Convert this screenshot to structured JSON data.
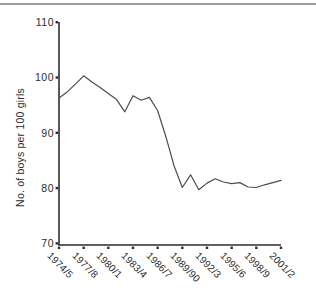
{
  "figure": {
    "background": "#ffffff",
    "top_rule_color": "#9d9d9d",
    "axis_color": "#2d2d2d",
    "line_color": "#4d4d4d"
  },
  "chart_data": {
    "type": "line",
    "title": "",
    "xlabel": "",
    "ylabel": "No. of boys per 100 girls",
    "ylim": [
      70,
      110
    ],
    "grid": false,
    "legend_position": "none",
    "y_ticks": [
      110,
      100,
      90,
      80,
      70
    ],
    "x_tick_labels": [
      "1974/5",
      "1977/8",
      "1980/1",
      "1983/4",
      "1986/7",
      "1989/90",
      "1992/3",
      "1995/6",
      "1998/9",
      "2001/2"
    ],
    "categories": [
      "1974/5",
      "1975/6",
      "1976/7",
      "1977/8",
      "1978/9",
      "1979/80",
      "1980/1",
      "1981/2",
      "1982/3",
      "1983/4",
      "1984/5",
      "1985/6",
      "1986/7",
      "1987/8",
      "1988/9",
      "1989/90",
      "1990/1",
      "1991/2",
      "1992/3",
      "1993/4",
      "1994/5",
      "1995/6",
      "1996/7",
      "1997/8",
      "1998/9",
      "1999/00",
      "2000/1",
      "2001/2"
    ],
    "series": [
      {
        "name": "No. of boys per 100 girls",
        "values": [
          96.3,
          97.4,
          98.8,
          100.3,
          99.2,
          98.2,
          97.1,
          96.0,
          93.8,
          96.7,
          95.9,
          96.4,
          94.0,
          89.3,
          84.0,
          80.1,
          82.4,
          79.7,
          80.9,
          81.7,
          81.1,
          80.8,
          81.0,
          80.2,
          80.1,
          80.6,
          81.0,
          81.4
        ]
      }
    ]
  }
}
